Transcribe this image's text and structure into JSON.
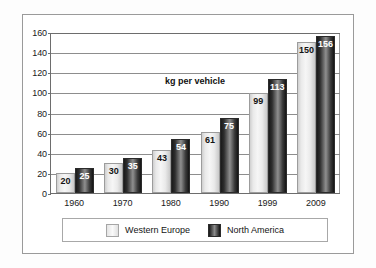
{
  "chart_data": {
    "type": "bar",
    "title": "",
    "annotation": "kg per vehicle",
    "xlabel": "",
    "ylabel": "",
    "ylim": [
      0,
      160
    ],
    "yticks": [
      0,
      20,
      40,
      60,
      80,
      100,
      120,
      140,
      160
    ],
    "ytick_labels": [
      "0",
      "20",
      "40",
      "60",
      "80",
      "100",
      "120",
      "140",
      "160"
    ],
    "grid": true,
    "legend_position": "bottom",
    "categories": [
      "1960",
      "1970",
      "1980",
      "1990",
      "1999",
      "2009"
    ],
    "series": [
      {
        "name": "Western Europe",
        "color": "#f2f2f2",
        "values": [
          20,
          30,
          43,
          61,
          99,
          150
        ],
        "value_labels": [
          "20",
          "30",
          "43",
          "61",
          "99",
          "150"
        ]
      },
      {
        "name": "North America",
        "color": "#1f1f1f",
        "values": [
          25,
          35,
          54,
          75,
          113,
          156
        ],
        "value_labels": [
          "25",
          "35",
          "54",
          "75",
          "113",
          "156"
        ]
      }
    ]
  },
  "legend": {
    "entries": [
      {
        "label": "Western Europe",
        "swatch": "light-gradient-swatch"
      },
      {
        "label": "North America",
        "swatch": "dark-gradient-swatch"
      }
    ]
  },
  "colors": {
    "axis": "#6d6d6d",
    "gridline": "#8d8d8d",
    "frame": "#9a9a9a",
    "text": "#1a1a1a",
    "western_europe": "#f2f2f2",
    "north_america": "#1f1f1f"
  }
}
